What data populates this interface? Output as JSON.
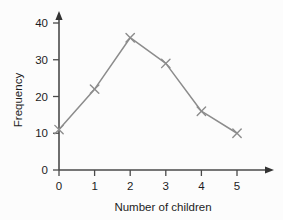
{
  "chart_data": {
    "type": "line",
    "title": "",
    "subtitle": "",
    "xlabel": "Number of children",
    "ylabel": "Frequency",
    "x": [
      0,
      1,
      2,
      3,
      4,
      5
    ],
    "values": [
      11,
      22,
      36,
      29,
      16,
      10
    ],
    "xticklabels": [
      "0",
      "1",
      "2",
      "3",
      "4",
      "5"
    ],
    "yticklabels": [
      "0",
      "10",
      "20",
      "30",
      "40"
    ],
    "yticks": [
      0,
      10,
      20,
      30,
      40
    ],
    "xlim": [
      0,
      5
    ],
    "ylim": [
      0,
      40
    ],
    "grid": false,
    "legend": false,
    "legend_position": "none",
    "marker": "x",
    "line_color": "#8c8c8c",
    "marker_color": "#8c8c8c",
    "axis_color": "#4a4a4a",
    "text_color": "#1c1c1c",
    "background_color": "#fcfcfc"
  }
}
